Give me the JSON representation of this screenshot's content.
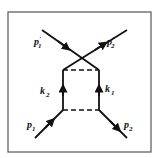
{
  "diagram": {
    "type": "feynman-box-diagram",
    "frame": {
      "x": 8,
      "y": 12,
      "width": 143,
      "height": 140,
      "stroke": "#555555"
    },
    "colors": {
      "line": "#111111",
      "background": "#ffffff"
    },
    "vertices": {
      "upper_left": [
        63,
        70
      ],
      "upper_right": [
        99,
        70
      ],
      "lower_left": [
        63,
        110
      ],
      "lower_right": [
        99,
        110
      ]
    },
    "external_lines": [
      {
        "id": "p1",
        "label": "p",
        "subscript": "1",
        "prime": false,
        "from": [
          35,
          138
        ],
        "to": [
          63,
          110
        ]
      },
      {
        "id": "p2",
        "label": "p",
        "subscript": "2",
        "prime": false,
        "from": [
          99,
          110
        ],
        "to": [
          127,
          138
        ]
      },
      {
        "id": "p1prime",
        "label": "p",
        "subscript": "1",
        "prime": true,
        "from": [
          99,
          70
        ],
        "to": [
          42,
          30
        ]
      },
      {
        "id": "p2prime",
        "label": "p",
        "subscript": "2",
        "prime": true,
        "from": [
          63,
          70
        ],
        "to": [
          127,
          30
        ]
      }
    ],
    "internal_lines": [
      {
        "id": "k2",
        "label": "k",
        "subscript": "2",
        "from": [
          63,
          110
        ],
        "to": [
          63,
          70
        ]
      },
      {
        "id": "k1",
        "label": "k",
        "subscript": "1",
        "from": [
          99,
          110
        ],
        "to": [
          99,
          70
        ]
      }
    ],
    "dashed_lines": [
      {
        "id": "top-exchange",
        "from": [
          63,
          70
        ],
        "to": [
          99,
          70
        ]
      },
      {
        "id": "bottom-exchange",
        "from": [
          63,
          110
        ],
        "to": [
          99,
          110
        ]
      }
    ],
    "labels": {
      "p1": {
        "main": "p",
        "sub": "1",
        "x": 27,
        "y": 126
      },
      "p2": {
        "main": "p",
        "sub": "2",
        "x": 127,
        "y": 126
      },
      "p1prime": {
        "main": "p",
        "sub": "1",
        "prime": "'",
        "x": 36,
        "y": 45
      },
      "p2prime": {
        "main": "p",
        "sub": "2",
        "prime": "'",
        "x": 107,
        "y": 45
      },
      "k1": {
        "main": "k",
        "sub": "1",
        "x": 105,
        "y": 92
      },
      "k2": {
        "main": "k",
        "sub": "2",
        "x": 38,
        "y": 92
      }
    }
  }
}
